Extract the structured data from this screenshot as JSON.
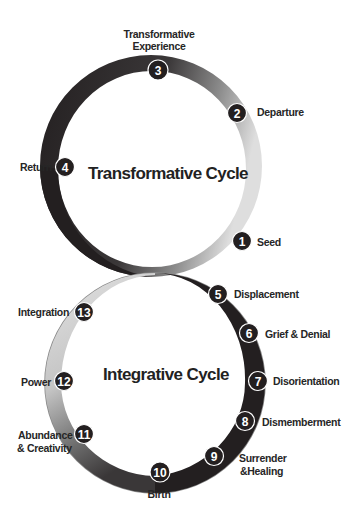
{
  "colors": {
    "dark": "#231f20",
    "mid": "#7a7a7a",
    "light": "#d6d6d6",
    "text": "#262626",
    "marker_fill": "#231f20",
    "marker_stroke": "#ffffff"
  },
  "transformative_cycle": {
    "title": "Transformative Cycle",
    "stages": [
      {
        "num": "1",
        "label": "Seed"
      },
      {
        "num": "2",
        "label": "Departure"
      },
      {
        "num": "3",
        "label_line1": "Transformative",
        "label_line2": "Experience"
      },
      {
        "num": "4",
        "label": "Return"
      }
    ]
  },
  "integrative_cycle": {
    "title": "Integrative Cycle",
    "stages": [
      {
        "num": "5",
        "label": "Displacement"
      },
      {
        "num": "6",
        "label": "Grief & Denial"
      },
      {
        "num": "7",
        "label": "Disorientation"
      },
      {
        "num": "8",
        "label": "Dismemberment"
      },
      {
        "num": "9",
        "label_line1": "Surrender",
        "label_line2": "&Healing"
      },
      {
        "num": "10",
        "label": "Birth"
      },
      {
        "num": "11",
        "label_line1": "Abundance",
        "label_line2": "& Creativity"
      },
      {
        "num": "12",
        "label": "Power"
      },
      {
        "num": "13",
        "label": "Integration"
      }
    ]
  }
}
